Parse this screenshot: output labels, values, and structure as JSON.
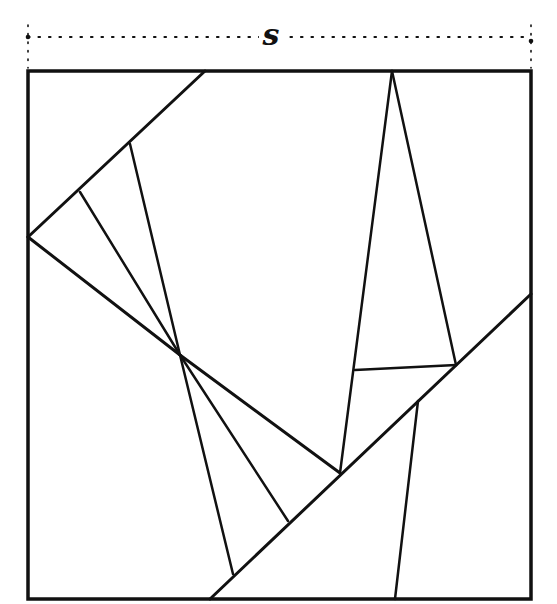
{
  "diagram": {
    "dimension_label": "s",
    "colors": {
      "ink": "#111111",
      "background": "#ffffff"
    },
    "dimension_line": {
      "y": 37,
      "x1": 28,
      "x2": 531
    },
    "square": {
      "x1": 28,
      "y1": 71,
      "x2": 531,
      "y2": 599
    },
    "segments": [
      {
        "id": "top-diagonal",
        "x1": 205,
        "y1": 71,
        "x2": 28,
        "y2": 237,
        "width": 3
      },
      {
        "id": "left-to-hub",
        "x1": 28,
        "y1": 237,
        "x2": 180,
        "y2": 355,
        "width": 3
      },
      {
        "id": "hub-to-junction",
        "x1": 180,
        "y1": 355,
        "x2": 340,
        "y2": 473,
        "width": 3
      },
      {
        "id": "foot-1-to-hub",
        "x1": 80,
        "y1": 192,
        "x2": 180,
        "y2": 355,
        "width": 2.5
      },
      {
        "id": "foot-2-to-hub",
        "x1": 130,
        "y1": 144,
        "x2": 180,
        "y2": 355,
        "width": 2.5
      },
      {
        "id": "hub-fan-1",
        "x1": 180,
        "y1": 355,
        "x2": 288,
        "y2": 521,
        "width": 2.5
      },
      {
        "id": "hub-fan-2",
        "x1": 180,
        "y1": 355,
        "x2": 233,
        "y2": 574,
        "width": 2.5
      },
      {
        "id": "long-diagonal",
        "x1": 531,
        "y1": 294,
        "x2": 210,
        "y2": 599,
        "width": 3
      },
      {
        "id": "apex-left",
        "x1": 392,
        "y1": 71,
        "x2": 340,
        "y2": 473,
        "width": 2.5
      },
      {
        "id": "apex-right",
        "x1": 392,
        "y1": 71,
        "x2": 456,
        "y2": 365,
        "width": 2.5
      },
      {
        "id": "cross-bar",
        "x1": 355,
        "y1": 370,
        "x2": 456,
        "y2": 365,
        "width": 2.5
      },
      {
        "id": "lower-right-vertical",
        "x1": 418,
        "y1": 401,
        "x2": 395,
        "y2": 599,
        "width": 2.5
      }
    ]
  }
}
